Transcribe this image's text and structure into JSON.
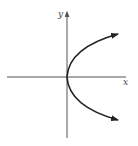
{
  "diagram": {
    "type": "parabola-graph",
    "equation_shape": "x = y^2 (opens right)",
    "axes": {
      "x_label": "x",
      "y_label": "y"
    },
    "curve": {
      "vertex": "origin",
      "direction": "right",
      "arrows": [
        "upper-right",
        "lower-right"
      ]
    },
    "colors": {
      "axis": "#555555",
      "curve": "#222222",
      "background": "#ffffff"
    }
  }
}
